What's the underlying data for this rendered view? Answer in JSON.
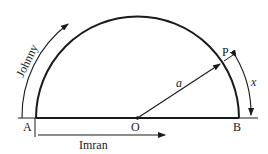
{
  "diagram": {
    "type": "semicircle-geometry",
    "labels": {
      "point_a": "A",
      "point_o": "O",
      "point_b": "B",
      "point_p": "P",
      "radius": "a",
      "arc_length": "x",
      "path_johnny": "Johnny",
      "path_imran": "Imran"
    },
    "colors": {
      "stroke": "#1a1a1a",
      "background": "#ffffff"
    }
  }
}
